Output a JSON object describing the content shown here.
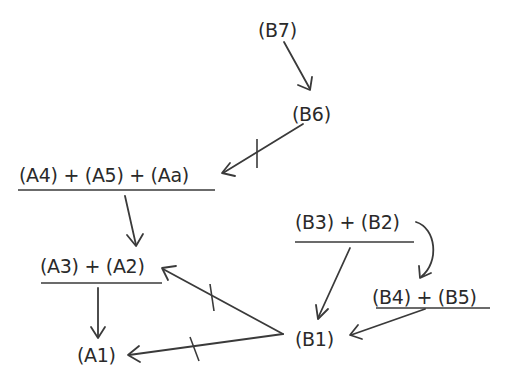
{
  "diagram": {
    "nodes": {
      "b7": {
        "label": "(B7)"
      },
      "b6": {
        "label": "(B6)"
      },
      "a4_a5_aa": {
        "label": "(A4) + (A5) + (Aa)"
      },
      "a3_a2": {
        "label": "(A3) + (A2)"
      },
      "a1": {
        "label": "(A1)"
      },
      "b1": {
        "label": "(B1)"
      },
      "b3_b2": {
        "label": "(B3) + (B2)"
      },
      "b4_b5": {
        "label": "(B4) + (B5)"
      }
    },
    "edges": [
      {
        "from": "(B7)",
        "to": "(B6)",
        "negated": false
      },
      {
        "from": "(B6)",
        "to": "(A4) + (A5) + (Aa)",
        "negated": true
      },
      {
        "from": "(A4) + (A5) + (Aa)",
        "to": "(A3) + (A2)",
        "negated": false
      },
      {
        "from": "(A3) + (A2)",
        "to": "(A1)",
        "negated": false
      },
      {
        "from": "(B1)",
        "to": "(A3) + (A2)",
        "negated": true
      },
      {
        "from": "(B1)",
        "to": "(A1)",
        "negated": true
      },
      {
        "from": "(B3) + (B2)",
        "to": "(B1)",
        "negated": false
      },
      {
        "from": "(B3) + (B2)",
        "to": "(B4) + (B5)",
        "negated": false,
        "curved": true
      },
      {
        "from": "(B4) + (B5)",
        "to": "(B1)",
        "negated": false
      }
    ],
    "colors": {
      "ink": "#2a2a2a",
      "background": "#ffffff"
    }
  }
}
